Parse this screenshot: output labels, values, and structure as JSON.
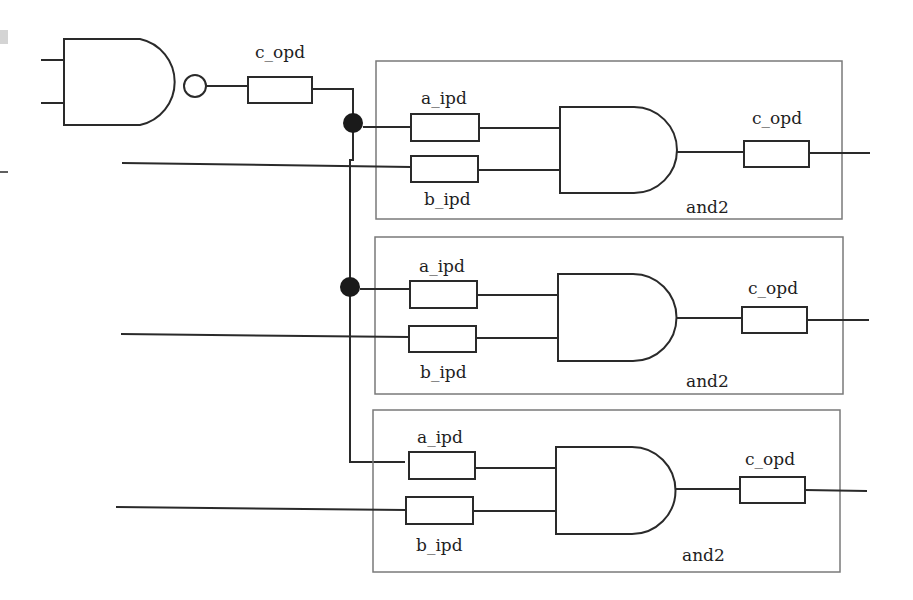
{
  "nand_gate": {
    "label": "",
    "output_delay_label": "c_opd"
  },
  "and_gates": [
    {
      "name": "and2",
      "input_a_label": "a_ipd",
      "input_b_label": "b_ipd",
      "output_label": "c_opd"
    },
    {
      "name": "and2",
      "input_a_label": "a_ipd",
      "input_b_label": "b_ipd",
      "output_label": "c_opd"
    },
    {
      "name": "and2",
      "input_a_label": "a_ipd",
      "input_b_label": "b_ipd",
      "output_label": "c_opd"
    }
  ],
  "colors": {
    "wire": "#2a2a2a",
    "frame": "#7a7a7a",
    "junction": "#1a1a1a"
  }
}
